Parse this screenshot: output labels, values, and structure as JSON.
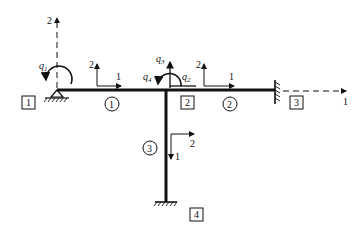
{
  "diagram": {
    "type": "frame-structure-dof",
    "nodes": [
      {
        "id": "1",
        "label": "1",
        "support": "pin"
      },
      {
        "id": "2",
        "label": "2",
        "support": "none"
      },
      {
        "id": "3",
        "label": "3",
        "support": "fixed-wall"
      },
      {
        "id": "4",
        "label": "4",
        "support": "fixed-ground"
      }
    ],
    "elements": [
      {
        "id": "1",
        "label": "1",
        "from": "1",
        "to": "2"
      },
      {
        "id": "2",
        "label": "2",
        "from": "2",
        "to": "3"
      },
      {
        "id": "3",
        "label": "3",
        "from": "2",
        "to": "4"
      }
    ],
    "global_axes": {
      "axis1": "1",
      "axis2": "2"
    },
    "local_axes": {
      "element1": {
        "axis1": "1",
        "axis2": "2"
      },
      "element2": {
        "axis1": "1",
        "axis2": "2"
      },
      "element3": {
        "axis1": "1",
        "axis2": "2"
      }
    },
    "dofs": [
      {
        "name": "q",
        "sub": "1"
      },
      {
        "name": "q",
        "sub": "2"
      },
      {
        "name": "q",
        "sub": "3"
      },
      {
        "name": "q",
        "sub": "4"
      }
    ]
  }
}
